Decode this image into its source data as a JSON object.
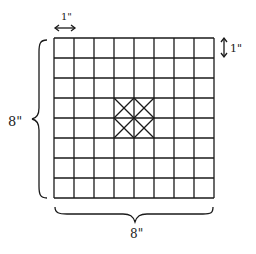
{
  "diagram": {
    "grid": {
      "rows": 8,
      "cols": 8,
      "x": 54,
      "y": 38,
      "cell": 20
    },
    "marked_cells": [
      [
        3,
        3
      ],
      [
        3,
        4
      ],
      [
        4,
        3
      ],
      [
        4,
        4
      ]
    ],
    "labels": {
      "top_cell_width": "1\"",
      "right_cell_height": "1\"",
      "left_total_height": "8\"",
      "bottom_total_width": "8\""
    },
    "colors": {
      "line": "#1a1a1a",
      "background": "#ffffff"
    }
  }
}
